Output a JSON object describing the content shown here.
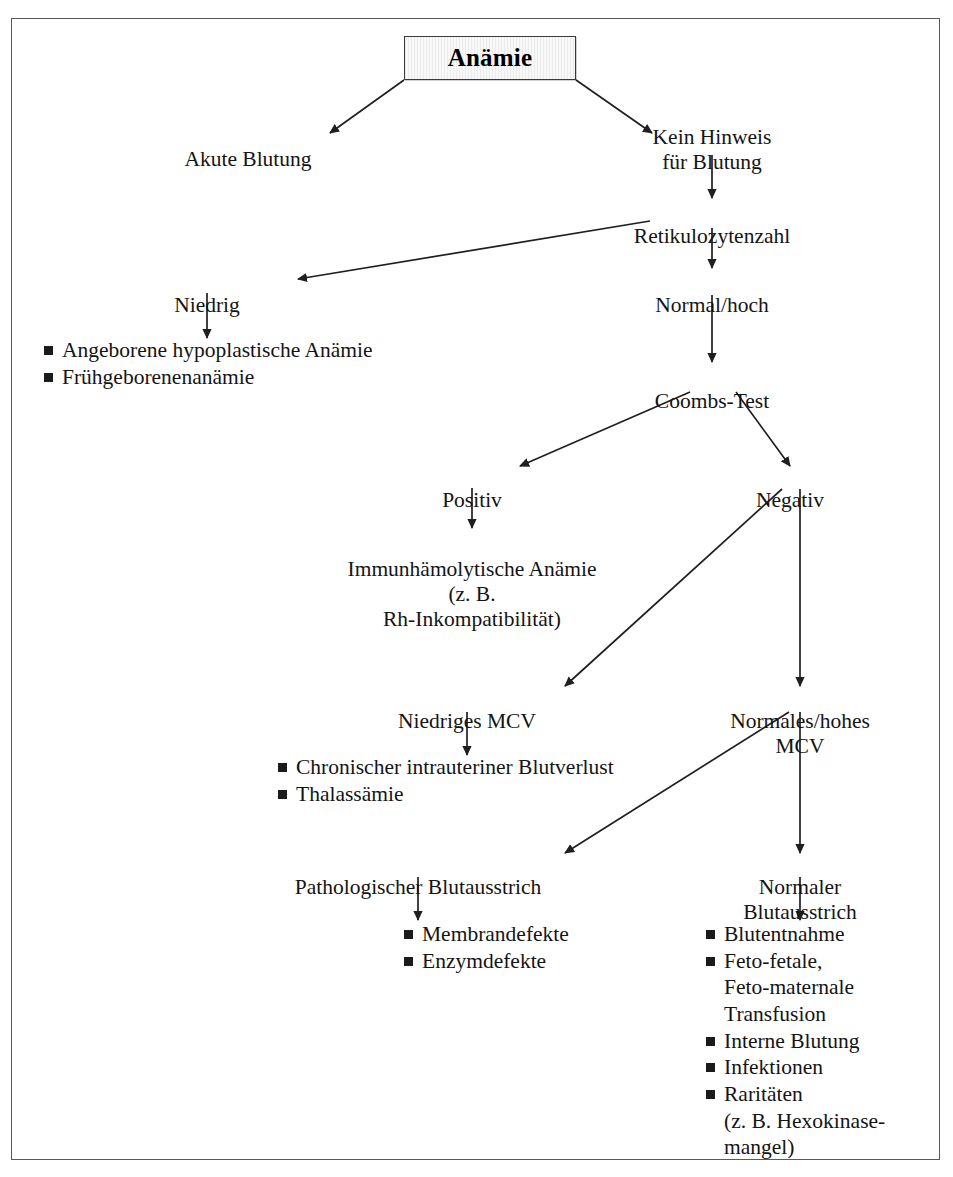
{
  "document": {
    "kind": "clinical-decision-flowchart",
    "language": "de",
    "title": "Anämie"
  },
  "nodes": {
    "root": {
      "label": "Anämie"
    },
    "akute_blutung": {
      "label": "Akute Blutung"
    },
    "kein_hinweis": {
      "label": "Kein Hinweis\nfür Blutung"
    },
    "retikulozytenzahl": {
      "label": "Retikulozytenzahl"
    },
    "niedrig": {
      "label": "Niedrig"
    },
    "normal_hoch": {
      "label": "Normal/hoch"
    },
    "coombs_test": {
      "label": "Coombs-Test"
    },
    "positiv": {
      "label": "Positiv"
    },
    "negativ": {
      "label": "Negativ"
    },
    "immunhaemolytische": {
      "label": "Immunhämolytische Anämie\n(z. B.\nRh-Inkompatibilität)"
    },
    "niedriges_mcv": {
      "label": "Niedriges MCV"
    },
    "normales_hohes_mcv": {
      "label": "Normales/hohes MCV"
    },
    "pathologischer_blutausstrich": {
      "label": "Pathologischer Blutausstrich"
    },
    "normaler_blutausstrich": {
      "label": "Normaler Blutausstrich"
    }
  },
  "bullet_lists": {
    "niedrig_causes": {
      "items": [
        {
          "text": "Angeborene hypoplastische Anämie",
          "marker": true
        },
        {
          "text": "Frühgeborenenanämie",
          "marker": true
        }
      ]
    },
    "niedriges_mcv_causes": {
      "items": [
        {
          "text": "Chronischer intrauteriner Blutverlust",
          "marker": true
        },
        {
          "text": "Thalassämie",
          "marker": true
        }
      ]
    },
    "pathologischer_causes": {
      "items": [
        {
          "text": "Membrandefekte",
          "marker": true
        },
        {
          "text": "Enzymdefekte",
          "marker": true
        }
      ]
    },
    "normaler_causes": {
      "items": [
        {
          "text": "Blutentnahme",
          "marker": true
        },
        {
          "text": "Feto-fetale,\nFeto-maternale\nTransfusion",
          "marker": true
        },
        {
          "text": "Interne Blutung",
          "marker": true
        },
        {
          "text": "Infektionen",
          "marker": true
        },
        {
          "text": "Raritäten\n(z. B. Hexokinase-\nmangel)",
          "marker": true
        }
      ]
    }
  },
  "colors": {
    "frame_border": "#5a5a5a",
    "box_border": "#3a3a3a",
    "box_fill": "#f0f0f0",
    "text": "#141414",
    "edge": "#1f1f1f",
    "bullet_marker": "#1b1b1b"
  }
}
